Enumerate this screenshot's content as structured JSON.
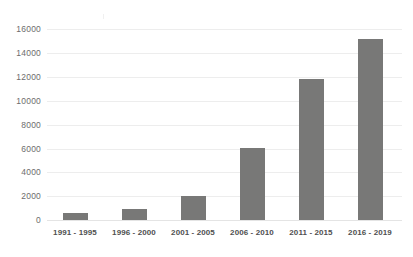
{
  "chart_data": {
    "type": "bar",
    "title": "",
    "subtitle": "",
    "xlabel": "",
    "ylabel": "",
    "categories": [
      "1991 - 1995",
      "1996 - 2000",
      "2001 - 2005",
      "2006 - 2010",
      "2011 - 2015",
      "2016 - 2019"
    ],
    "values": [
      550,
      950,
      2050,
      6000,
      11800,
      15200
    ],
    "series": [
      {
        "name": "Count",
        "values": [
          550,
          950,
          2050,
          6000,
          11800,
          15200
        ]
      }
    ],
    "ylim": [
      0,
      16000
    ],
    "yticks": [
      0,
      2000,
      4000,
      6000,
      8000,
      10000,
      12000,
      14000,
      16000
    ],
    "ytick_labels": [
      "0",
      "2000",
      "4000",
      "6000",
      "8000",
      "10000",
      "12000",
      "14000",
      "16000"
    ],
    "grid": true,
    "grid_axis": "y",
    "legend": false,
    "legend_position": "none",
    "bar_color": "#787877",
    "grid_color": "#ededed",
    "axis_color": "#e4e4e4",
    "background_color": "#ffffff",
    "ytick_label_color": "#6d6d6d",
    "xtick_label_color": "#4f4f4f"
  }
}
